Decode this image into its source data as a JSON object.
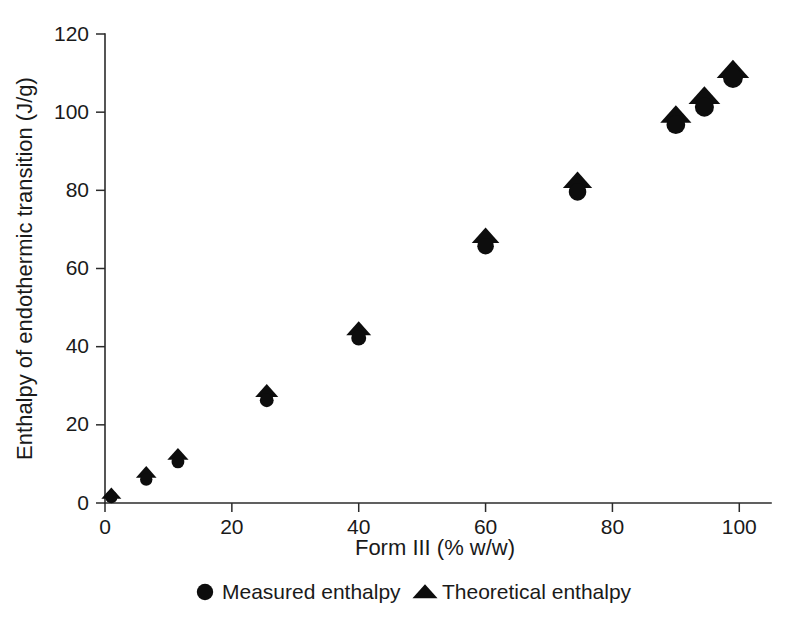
{
  "chart_data": {
    "type": "scatter",
    "title": "",
    "xlabel": "Form III (% w/w)",
    "ylabel": "Enthalpy of endothermic transition (J/g)",
    "xlim": [
      0,
      105
    ],
    "ylim": [
      0,
      120
    ],
    "xticks": [
      0,
      20,
      40,
      60,
      80,
      100
    ],
    "yticks": [
      0,
      20,
      40,
      60,
      80,
      100,
      120
    ],
    "xtick_labels": [
      "0",
      "20",
      "40",
      "60",
      "80",
      "100"
    ],
    "ytick_labels": [
      "0",
      "20",
      "40",
      "60",
      "80",
      "100",
      "120"
    ],
    "grid": false,
    "legend_position": "below-axis",
    "marker_color": "#0d0d0d",
    "axis_color": "#2b2b2b",
    "series": [
      {
        "name": "Measured enthalpy",
        "marker": "circle",
        "x": [
          1,
          6.5,
          11.5,
          25.5,
          40,
          60,
          74.5,
          90,
          94.5,
          99
        ],
        "y": [
          1.5,
          6,
          10.5,
          26.3,
          42.2,
          65.7,
          79.6,
          96.8,
          101.3,
          108.7
        ]
      },
      {
        "name": "Theoretical enthalpy",
        "marker": "triangle",
        "x": [
          1,
          6.5,
          11.5,
          25.5,
          40,
          60,
          74.5,
          90,
          94.5,
          99
        ],
        "y": [
          2.2,
          7.6,
          12.2,
          28.4,
          44.3,
          68.0,
          82.2,
          99.0,
          103.8,
          110.5
        ]
      }
    ]
  },
  "legend": {
    "items": [
      {
        "label": "Measured enthalpy",
        "marker": "circle"
      },
      {
        "label": "Theoretical enthalpy",
        "marker": "triangle"
      }
    ]
  }
}
